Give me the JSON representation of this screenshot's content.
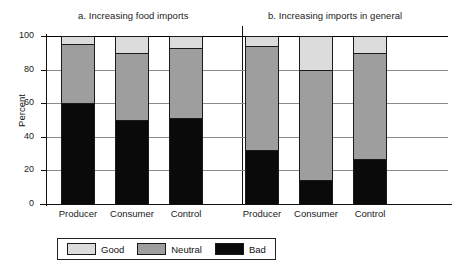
{
  "chart_data": {
    "type": "bar",
    "subtype": "stacked-bar",
    "title": "",
    "xlabel": "",
    "ylabel": "Percent",
    "ylim": [
      0,
      100
    ],
    "yticks": [
      0,
      20,
      40,
      60,
      80,
      100
    ],
    "grid": true,
    "legend_position": "bottom",
    "stack_order_bottom_to_top": [
      "Bad",
      "Neutral",
      "Good"
    ],
    "series": [
      {
        "name": "Good",
        "color": "#dcdcdc"
      },
      {
        "name": "Neutral",
        "color": "#9e9e9e"
      },
      {
        "name": "Bad",
        "color": "#0a0a0a"
      }
    ],
    "panels": [
      {
        "id": "a",
        "title": "a. Increasing food imports",
        "categories": [
          "Producer",
          "Consumer",
          "Control"
        ],
        "series": [
          {
            "name": "Bad",
            "values": [
              60,
              50,
              51
            ]
          },
          {
            "name": "Neutral",
            "values": [
              35,
              40,
              42
            ]
          },
          {
            "name": "Good",
            "values": [
              5,
              10,
              7
            ]
          }
        ]
      },
      {
        "id": "b",
        "title": "b. Increasing imports in general",
        "categories": [
          "Producer",
          "Consumer",
          "Control"
        ],
        "series": [
          {
            "name": "Bad",
            "values": [
              32,
              14,
              27
            ]
          },
          {
            "name": "Neutral",
            "values": [
              62,
              66,
              63
            ]
          },
          {
            "name": "Good",
            "values": [
              6,
              20,
              10
            ]
          }
        ]
      }
    ]
  },
  "axis": {
    "ylabel": "Percent",
    "ytick_labels": [
      "100",
      "80",
      "60",
      "40",
      "20",
      "0"
    ]
  },
  "panel_a": {
    "title": "a. Increasing food imports",
    "xlabels": [
      "Producer",
      "Consumer",
      "Control"
    ]
  },
  "panel_b": {
    "title": "b. Increasing imports in general",
    "xlabels": [
      "Producer",
      "Consumer",
      "Control"
    ]
  },
  "legend": {
    "items": [
      {
        "label": "Good",
        "color": "#dcdcdc"
      },
      {
        "label": "Neutral",
        "color": "#9e9e9e"
      },
      {
        "label": "Bad",
        "color": "#0a0a0a"
      }
    ]
  }
}
